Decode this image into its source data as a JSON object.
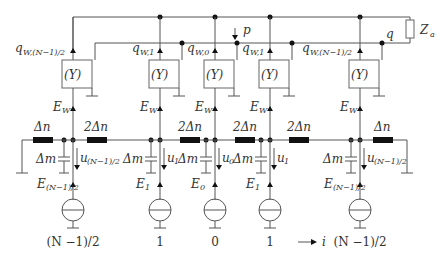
{
  "diagram": {
    "type": "circuit",
    "load_label": "Z",
    "load_sub": "a",
    "p_label": "p",
    "q_label": "q",
    "block_label": "(Y)",
    "ew_label": "E",
    "ew_sub": "W",
    "delta_n": "Δn",
    "two_delta_n": "2Δn",
    "delta_m": "Δm",
    "axis_label": "i",
    "columns": [
      {
        "q": "q",
        "q_sub": "W,(N−1)/2",
        "u_sub": "(N−1)/2",
        "e_sub": "(N−1)/2",
        "index": "(N −1)/2"
      },
      {
        "q": "q",
        "q_sub": "W,1",
        "u_sub": "1",
        "e_sub": "1",
        "index": "1"
      },
      {
        "q": "q",
        "q_sub": "W,0",
        "u_sub": "0",
        "e_sub": "0",
        "index": "0"
      },
      {
        "q": "q",
        "q_sub": "W,1",
        "u_sub": "1",
        "e_sub": "1",
        "index": "1"
      },
      {
        "q": "q",
        "q_sub": "W,(N−1)/2",
        "u_sub": "(N−1)/2",
        "e_sub": "(N−1)/2",
        "index": "(N −1)/2"
      }
    ]
  }
}
